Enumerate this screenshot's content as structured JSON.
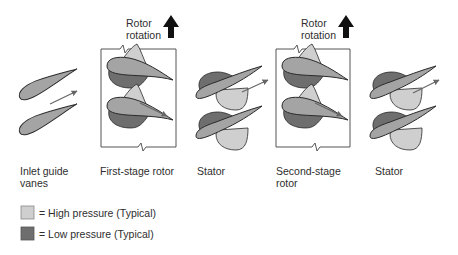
{
  "colors": {
    "high_pressure": "#cfcfcf",
    "low_pressure": "#6e6e6e",
    "blade": "#a4a4a4",
    "outline": "#2a2a2a",
    "flow_arrow": "#666666",
    "rotation_arrow": "#111111"
  },
  "rotor_rotation": [
    {
      "line1": "Rotor",
      "line2": "rotation",
      "icon": "up-arrow-icon"
    },
    {
      "line1": "Rotor",
      "line2": "rotation",
      "icon": "up-arrow-icon"
    }
  ],
  "stages": [
    {
      "id": "inlet-guide-vanes",
      "label_line1": "Inlet guide",
      "label_line2": "vanes",
      "boxed": false
    },
    {
      "id": "first-stage-rotor",
      "label_line1": "First-stage rotor",
      "label_line2": "",
      "boxed": true
    },
    {
      "id": "stator-1",
      "label_line1": "Stator",
      "label_line2": "",
      "boxed": false
    },
    {
      "id": "second-stage-rotor",
      "label_line1": "Second-stage",
      "label_line2": "rotor",
      "boxed": true
    },
    {
      "id": "stator-2",
      "label_line1": "Stator",
      "label_line2": "",
      "boxed": false
    }
  ],
  "legend": [
    {
      "swatch": "high",
      "text": "= High pressure (Typical)"
    },
    {
      "swatch": "low",
      "text": "= Low pressure (Typical)"
    }
  ]
}
